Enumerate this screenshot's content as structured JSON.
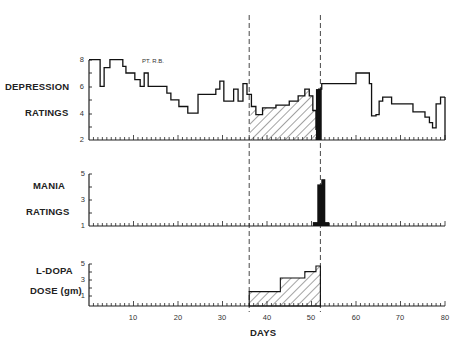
{
  "chart_data": [
    {
      "type": "line",
      "title": "DEPRESSION RATINGS",
      "annotation": "PT. R.B.",
      "ylabel": "DEPRESSION RATINGS",
      "xlabel": "DAYS",
      "ylim": [
        2,
        8
      ],
      "yticks": [
        "2",
        "4",
        "6",
        "8"
      ],
      "steps": [
        [
          0,
          8
        ],
        [
          2.5,
          6
        ],
        [
          3.4,
          7.4
        ],
        [
          4.7,
          8
        ],
        [
          7.6,
          7.5
        ],
        [
          8.3,
          7
        ],
        [
          10.3,
          6.5
        ],
        [
          11.5,
          6
        ],
        [
          12.4,
          7
        ],
        [
          13.3,
          6
        ],
        [
          17.5,
          5.5
        ],
        [
          18.4,
          5
        ],
        [
          20.2,
          4.5
        ],
        [
          22.2,
          4
        ],
        [
          24.5,
          5.4
        ],
        [
          28.5,
          5.8
        ],
        [
          29.4,
          6.4
        ],
        [
          30.3,
          4.9
        ],
        [
          32.5,
          5.8
        ],
        [
          33.5,
          4.9
        ],
        [
          34.6,
          6.2
        ],
        [
          35.5,
          5.4
        ],
        [
          36.5,
          4.5
        ],
        [
          37.5,
          3.9
        ],
        [
          39,
          4.4
        ],
        [
          42,
          4.6
        ],
        [
          45,
          4.9
        ],
        [
          47,
          5.3
        ],
        [
          48.5,
          5.8
        ],
        [
          49.5,
          5.3
        ],
        [
          50.3,
          4.2
        ],
        [
          51,
          2.8
        ],
        [
          51.6,
          5.8
        ],
        [
          52.3,
          6.2
        ],
        [
          60,
          7
        ],
        [
          63,
          6.2
        ],
        [
          63.5,
          3.8
        ],
        [
          64.5,
          3.9
        ],
        [
          65.2,
          4.9
        ],
        [
          66,
          5.2
        ],
        [
          68,
          4.7
        ],
        [
          72.8,
          4.1
        ],
        [
          75.5,
          3.7
        ],
        [
          76.5,
          3.3
        ],
        [
          77.2,
          2.9
        ],
        [
          78,
          4.7
        ],
        [
          79,
          5.2
        ],
        [
          80,
          5.2
        ]
      ],
      "hatched_period_days": [
        36,
        52
      ],
      "solid_black_period_days": [
        51,
        52.3
      ]
    },
    {
      "type": "bar",
      "title": "MANIA RATINGS",
      "ylabel": "MANIA RATINGS",
      "ylim": [
        1,
        5
      ],
      "yticks": [
        "1",
        "3",
        "5"
      ],
      "bars": [
        {
          "day_start": 50.3,
          "day_end": 54,
          "value": 1.3
        },
        {
          "day_start": 51.3,
          "day_end": 52.7,
          "value": 4.2
        },
        {
          "day_start": 52.2,
          "day_end": 53.1,
          "value": 4.6
        }
      ]
    },
    {
      "type": "area",
      "title": "L-DOPA DOSE (gm)",
      "ylabel": "L-DOPA DOSE (gm)",
      "ylim": [
        0,
        5
      ],
      "yticks": [
        "1",
        "3",
        "5"
      ],
      "steps": [
        [
          36,
          1.8
        ],
        [
          43,
          1.8
        ],
        [
          43,
          3.5
        ],
        [
          48.5,
          3.5
        ],
        [
          48.5,
          4.3
        ],
        [
          51,
          4.3
        ],
        [
          51,
          5
        ],
        [
          52,
          5
        ]
      ]
    }
  ],
  "x_axis": {
    "label": "DAYS",
    "ticks": [
      "10",
      "20",
      "30",
      "40",
      "50",
      "60",
      "70",
      "80"
    ],
    "range": [
      0,
      80
    ]
  },
  "labels": {
    "depression_1": "DEPRESSION",
    "depression_2": "RATINGS",
    "mania_1": "MANIA",
    "mania_2": "RATINGS",
    "ldopa_1": "L-DOPA",
    "ldopa_2": "DOSE (gm)",
    "patient": "PT. R.B.",
    "xlabel": "DAYS"
  },
  "yticks": {
    "dep": [
      "8",
      "6",
      "4",
      "2"
    ],
    "mania": [
      "5",
      "3",
      "1"
    ],
    "dose": [
      "5",
      "3",
      "1"
    ]
  }
}
